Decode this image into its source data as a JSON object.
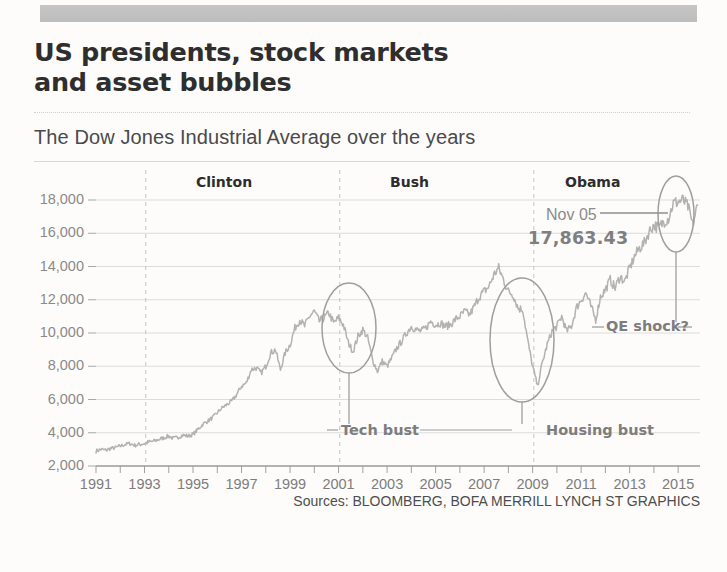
{
  "headline": {
    "line1": "US presidents, stock markets",
    "line2": "and asset bubbles"
  },
  "subhead": "The Dow Jones Industrial Average over the years",
  "source": "Sources: BLOOMBERG, BOFA MERRILL LYNCH   ST GRAPHICS",
  "presidents": [
    {
      "name": "Clinton"
    },
    {
      "name": "Bush"
    },
    {
      "name": "Obama"
    }
  ],
  "annotations": {
    "nov_label": "Nov 05",
    "nov_value": "17,863.43",
    "qe_shock": "QE shock?",
    "tech_bust": "Tech bust",
    "housing_bust": "Housing bust"
  },
  "colors": {
    "line": "#b0b0b0",
    "grid": "#dcdcdc",
    "axis": "#8a8a8a",
    "text": "#3c3c3c",
    "topbar": "#bebebe",
    "annotation": "#7d7d7d"
  },
  "chart_data": {
    "type": "line",
    "title": "The Dow Jones Industrial Average over the years",
    "xlabel": "",
    "ylabel": "",
    "grid": true,
    "legend": "none",
    "xlim": [
      1991,
      2015.9
    ],
    "ylim": [
      2000,
      18000
    ],
    "yticks": [
      2000,
      4000,
      6000,
      8000,
      10000,
      12000,
      14000,
      16000,
      18000
    ],
    "ytick_labels": [
      "2,000",
      "4,000",
      "6,000",
      "8,000",
      "10,000",
      "12,000",
      "14,000",
      "16,000",
      "18,000"
    ],
    "xticks": [
      1991,
      1992,
      1993,
      1994,
      1995,
      1996,
      1997,
      1998,
      1999,
      2000,
      2001,
      2002,
      2003,
      2004,
      2005,
      2006,
      2007,
      2008,
      2009,
      2010,
      2011,
      2012,
      2013,
      2014,
      2015
    ],
    "xtick_labels": [
      "1991",
      "",
      "1993",
      "",
      "1995",
      "",
      "1997",
      "",
      "1999",
      "",
      "2001",
      "",
      "2003",
      "",
      "2005",
      "",
      "2007",
      "",
      "2009",
      "",
      "2011",
      "",
      "2013",
      "",
      "2015"
    ],
    "president_dividers": [
      1993.05,
      2001.05,
      2009.05
    ],
    "series": [
      {
        "name": "Dow Jones Industrial Average",
        "x": [
          1991.0,
          1991.2,
          1991.4,
          1991.6,
          1991.8,
          1992.0,
          1992.2,
          1992.4,
          1992.6,
          1992.8,
          1993.0,
          1993.2,
          1993.4,
          1993.6,
          1993.8,
          1994.0,
          1994.2,
          1994.4,
          1994.6,
          1994.8,
          1995.0,
          1995.2,
          1995.4,
          1995.6,
          1995.8,
          1996.0,
          1996.2,
          1996.4,
          1996.6,
          1996.8,
          1997.0,
          1997.2,
          1997.4,
          1997.6,
          1997.8,
          1998.0,
          1998.2,
          1998.4,
          1998.6,
          1998.8,
          1999.0,
          1999.2,
          1999.4,
          1999.6,
          1999.8,
          2000.0,
          2000.2,
          2000.4,
          2000.6,
          2000.8,
          2001.0,
          2001.2,
          2001.4,
          2001.6,
          2001.8,
          2002.0,
          2002.2,
          2002.4,
          2002.6,
          2002.8,
          2003.0,
          2003.2,
          2003.4,
          2003.6,
          2003.8,
          2004.0,
          2004.2,
          2004.4,
          2004.6,
          2004.8,
          2005.0,
          2005.2,
          2005.4,
          2005.6,
          2005.8,
          2006.0,
          2006.2,
          2006.4,
          2006.6,
          2006.8,
          2007.0,
          2007.2,
          2007.4,
          2007.6,
          2007.8,
          2008.0,
          2008.2,
          2008.4,
          2008.6,
          2008.8,
          2009.0,
          2009.2,
          2009.4,
          2009.6,
          2009.8,
          2010.0,
          2010.2,
          2010.4,
          2010.6,
          2010.8,
          2011.0,
          2011.2,
          2011.4,
          2011.6,
          2011.8,
          2012.0,
          2012.2,
          2012.4,
          2012.6,
          2012.8,
          2013.0,
          2013.2,
          2013.4,
          2013.6,
          2013.8,
          2014.0,
          2014.2,
          2014.4,
          2014.6,
          2014.8,
          2015.0,
          2015.2,
          2015.4,
          2015.6,
          2015.8
        ],
        "y": [
          2900,
          3000,
          2950,
          3050,
          3100,
          3200,
          3300,
          3350,
          3250,
          3300,
          3350,
          3450,
          3500,
          3600,
          3700,
          3800,
          3650,
          3750,
          3850,
          3800,
          3900,
          4200,
          4500,
          4700,
          4900,
          5200,
          5500,
          5700,
          5900,
          6300,
          6800,
          7000,
          7800,
          7900,
          7600,
          8000,
          8800,
          9000,
          7800,
          8800,
          9300,
          10300,
          10800,
          10400,
          11000,
          11300,
          10700,
          10900,
          11200,
          10600,
          10900,
          10500,
          9400,
          8900,
          9800,
          10200,
          9700,
          8400,
          7700,
          8300,
          8000,
          8500,
          9100,
          9500,
          10000,
          10400,
          10200,
          10100,
          10300,
          10700,
          10500,
          10600,
          10400,
          10500,
          10800,
          11000,
          11300,
          11100,
          11600,
          12200,
          12500,
          12800,
          13500,
          13900,
          13200,
          12500,
          12300,
          11500,
          11400,
          9500,
          8000,
          6800,
          8200,
          9300,
          10100,
          10400,
          11000,
          10100,
          10400,
          11500,
          12000,
          12400,
          11600,
          10800,
          12200,
          12600,
          13200,
          12700,
          13400,
          13100,
          13900,
          14600,
          15100,
          15400,
          16100,
          16500,
          16300,
          16700,
          16900,
          17800,
          17900,
          18000,
          17600,
          16500,
          17700
        ]
      }
    ],
    "highlights": [
      {
        "label": "Tech bust",
        "center_x": 2000.2,
        "center_y": 10700
      },
      {
        "label": "Housing bust",
        "center_x": 2008.9,
        "center_y": 10200
      },
      {
        "label": "QE shock?",
        "center_x": 2015.3,
        "center_y": 17500
      }
    ],
    "callout": {
      "date_label": "Nov 05",
      "value_label": "17,863.43",
      "value": 17863.43
    }
  }
}
